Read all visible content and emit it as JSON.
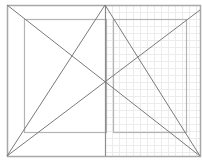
{
  "diagram": {
    "width": 202,
    "height": 163,
    "colors": {
      "background": "#ffffff",
      "frame": "#a8a8a8",
      "inner": "#b4b4b4",
      "diagonal": "#7a7a7a",
      "center": "#8c8c8c",
      "grid": "#ececec"
    },
    "outer_rect": {
      "x": 7,
      "y": 5,
      "w": 193,
      "h": 151
    },
    "inner_left_rect": {
      "x": 24,
      "y": 19,
      "w": 82,
      "h": 113
    },
    "inner_right_rect": {
      "x": 113,
      "y": 19,
      "w": 73,
      "h": 113
    },
    "center_line": {
      "x": 105,
      "y1": 5,
      "y2": 156
    },
    "grid": {
      "x0": 105,
      "x1": 200,
      "y0": 5,
      "y1": 156,
      "step": 7
    },
    "lines": [
      {
        "name": "diagonal-tl-br",
        "x1": 7,
        "y1": 5,
        "x2": 200,
        "y2": 156
      },
      {
        "name": "diagonal-bl-tr",
        "x1": 7,
        "y1": 156,
        "x2": 200,
        "y2": 10
      },
      {
        "name": "apex-to-bottom-left",
        "x1": 105,
        "y1": 5,
        "x2": 7,
        "y2": 156
      },
      {
        "name": "apex-to-bottom-right",
        "x1": 105,
        "y1": 5,
        "x2": 200,
        "y2": 156
      }
    ]
  }
}
